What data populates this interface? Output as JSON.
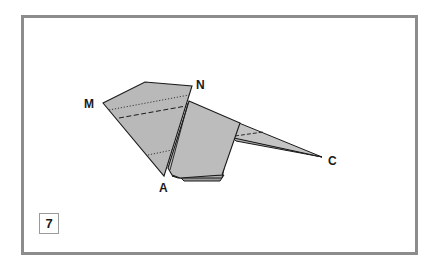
{
  "figure": {
    "step_number": "7",
    "labels": {
      "M": "M",
      "N": "N",
      "A": "A",
      "C": "C"
    },
    "colors": {
      "frame_border": "#8c8c8c",
      "paper_fill": "#b9b9b9",
      "paper_fill_light": "#c4c4c4",
      "paper_fill_dark": "#a8a8a8",
      "outline": "#1a1a1a",
      "background": "#ffffff"
    },
    "fold_lines": [
      {
        "type": "valley",
        "style": "dashed",
        "description": "fold line across head flap"
      },
      {
        "type": "mountain",
        "style": "dotted",
        "description": "upper dotted line across head flap"
      },
      {
        "type": "mountain",
        "style": "dotted",
        "description": "lower dotted line near A"
      },
      {
        "type": "valley",
        "style": "dashed",
        "description": "fold line on tail"
      }
    ]
  }
}
